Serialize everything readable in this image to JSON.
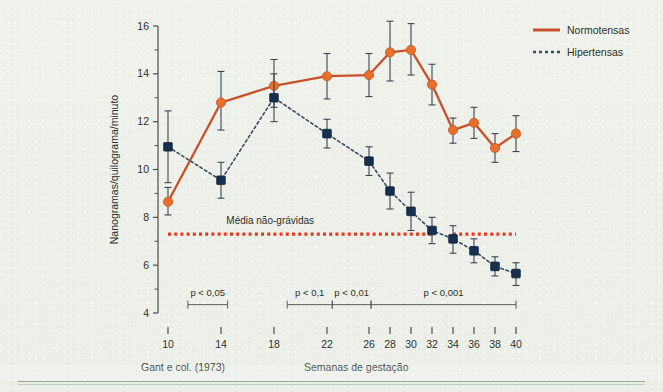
{
  "figure": {
    "source_caption": "Gant e col. (1973)",
    "x_axis_caption": "Semanas de gestação"
  },
  "chart_data": {
    "type": "line",
    "title": "",
    "xlabel": "Semanas de gestação",
    "ylabel": "Nanogramas/quilograma/minuto",
    "xlim": [
      9,
      41
    ],
    "ylim": [
      4,
      16
    ],
    "grid": false,
    "legend_position": "top-right",
    "x_tick_labels": [
      "10",
      "14",
      "18",
      "22",
      "26",
      "28",
      "30",
      "32",
      "34",
      "36",
      "38",
      "40"
    ],
    "x_tick_values": [
      10,
      14,
      18,
      22,
      26,
      28,
      30,
      32,
      34,
      36,
      38,
      40
    ],
    "y_tick_labels": [
      "4",
      "6",
      "8",
      "10",
      "12",
      "14",
      "16"
    ],
    "y_tick_values": [
      4,
      6,
      8,
      10,
      12,
      14,
      16
    ],
    "y_minor_tick_values": [
      5,
      7,
      9,
      11,
      13,
      15
    ],
    "series": [
      {
        "name": "Normotensas",
        "color": "#c8502b",
        "marker_color": "#e8702c",
        "marker": "circle",
        "line_style": "solid",
        "x": [
          10,
          14,
          18,
          22,
          26,
          28,
          30,
          32,
          34,
          36,
          38,
          40
        ],
        "values": [
          8.65,
          12.8,
          13.5,
          13.9,
          13.95,
          14.9,
          15.0,
          13.55,
          11.65,
          11.95,
          10.9,
          11.5
        ],
        "err_low": [
          0.55,
          1.15,
          0.9,
          0.95,
          0.9,
          1.2,
          1.05,
          0.85,
          0.55,
          0.65,
          0.6,
          0.75
        ],
        "err_high": [
          0.6,
          1.3,
          1.1,
          0.95,
          0.9,
          1.3,
          1.1,
          0.85,
          0.5,
          0.65,
          0.6,
          0.75
        ]
      },
      {
        "name": "Hipertensas",
        "color": "#3b4a60",
        "marker_color": "#16304f",
        "marker": "square",
        "line_style": "dotted",
        "x": [
          10,
          14,
          18,
          22,
          26,
          28,
          30,
          32,
          34,
          36,
          38,
          40
        ],
        "values": [
          10.95,
          9.55,
          13.0,
          11.5,
          10.35,
          9.1,
          8.25,
          7.45,
          7.1,
          6.6,
          5.95,
          5.65
        ],
        "err_low": [
          1.5,
          0.75,
          1.0,
          0.6,
          0.6,
          0.75,
          0.8,
          0.55,
          0.6,
          0.5,
          0.4,
          0.5
        ],
        "err_high": [
          1.5,
          0.75,
          1.0,
          0.6,
          0.6,
          0.75,
          0.8,
          0.55,
          0.55,
          0.5,
          0.4,
          0.45
        ]
      }
    ],
    "reference_line": {
      "label": "Média não-grávidas",
      "value": 7.3,
      "color": "#e03a20",
      "style": "dotted",
      "segments": [
        [
          10,
          32
        ],
        [
          34,
          40
        ]
      ]
    },
    "annotations": [
      {
        "label": "p < 0,05",
        "x_start": 11.5,
        "x_end": 14.5,
        "y": 4.35
      },
      {
        "label": "p < 0,1",
        "x_start": 19.0,
        "x_end": 22.5,
        "y": 4.35
      },
      {
        "label": "p < 0,01",
        "x_start": 22.5,
        "x_end": 26.2,
        "y": 4.35
      },
      {
        "label": "p < 0,001",
        "x_start": 26.2,
        "x_end": 40.0,
        "y": 4.35
      }
    ]
  }
}
